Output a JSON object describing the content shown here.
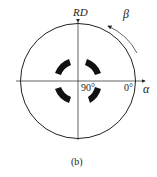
{
  "figure": {
    "caption": "(b)",
    "axis_top_label": "RD",
    "axis_right_label": "α",
    "rotation_label": "β",
    "angle_center_label": "90°",
    "angle_edge_label": "0°",
    "line_color": "#222222",
    "blob_color": "#111111"
  }
}
